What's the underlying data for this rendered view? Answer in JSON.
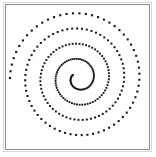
{
  "figure": {
    "background_color": "#ffffff",
    "width": 156,
    "height": 157,
    "frame": {
      "color": "#8c8c8c",
      "outer_color": "#d8d8d8",
      "left": 5,
      "top": 4,
      "width": 145,
      "height": 146
    }
  },
  "chart_data": {
    "type": "scatter",
    "title": "",
    "subtitle": "",
    "xlabel": "",
    "ylabel": "",
    "grid": false,
    "legend": null,
    "axis_ticks_visible": false,
    "axis_tick_labels": [],
    "marker": {
      "shape": "square",
      "color": "#1a1a1a",
      "size_px": 1.7
    },
    "spiral": {
      "equation": "r = a * theta",
      "a": 1.02,
      "theta_start_deg": 150,
      "theta_end_deg": 1620,
      "turns": 4.08,
      "num_points": 260,
      "theta_step_deg": 5.67,
      "center_x": 72.5,
      "center_y": 73.0,
      "max_radius_px": 68.5,
      "rotation_deg": 0,
      "direction": "counterclockwise"
    },
    "xlim": [
      -72.5,
      72.5
    ],
    "ylim": [
      -73.0,
      73.0
    ]
  }
}
